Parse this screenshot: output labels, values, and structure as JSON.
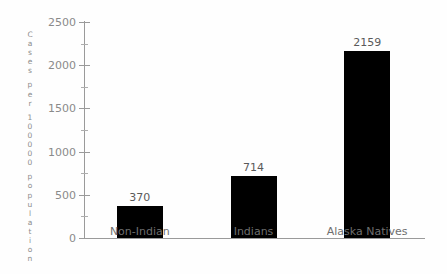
{
  "chart_data": {
    "type": "bar",
    "title": "",
    "xlabel": "",
    "ylabel": "Cases per 100000 population",
    "categories": [
      "Non-Indian",
      "Indians",
      "Alaska Natives"
    ],
    "values": [
      370,
      714,
      2159
    ],
    "value_labels": [
      "370",
      "714",
      "2159"
    ],
    "ylim": [
      0,
      2500
    ],
    "ytick_labels": [
      "0",
      "500",
      "1000",
      "1500",
      "2000",
      "2500"
    ],
    "ytick_values": [
      0,
      500,
      1000,
      1500,
      2000,
      2500
    ],
    "yminor_tick_values": [
      250,
      750,
      1250,
      1750,
      2250
    ],
    "grid": false,
    "legend": false,
    "bar_color": "#000000",
    "axis_color": "#9a9a9a",
    "label_color": "#8a8a8a"
  },
  "axis": {
    "y_caption_chars": [
      "C",
      "a",
      "s",
      "e",
      "s",
      "",
      "p",
      "e",
      "r",
      "",
      "1",
      "0",
      "0",
      "0",
      "0",
      "0",
      "",
      "p",
      "o",
      "p",
      "u",
      "l",
      "a",
      "t",
      "i",
      "o",
      "n"
    ]
  }
}
